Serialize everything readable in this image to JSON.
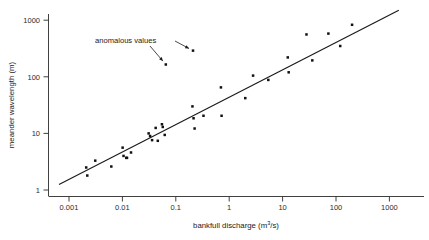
{
  "chart_data": {
    "type": "scatter",
    "title": "",
    "xlabel": "bankfull discharge (m³/s)",
    "xlabel_main": "bankfull discharge (m",
    "xlabel_sup": "3",
    "xlabel_tail": "/s)",
    "ylabel": "meander wavelength (m)",
    "xscale": "log",
    "yscale": "log",
    "xlim": [
      0.0005,
      2000
    ],
    "ylim": [
      0.65,
      2200
    ],
    "xticks": [
      0.001,
      0.01,
      0.1,
      1,
      10,
      100,
      1000
    ],
    "xtick_labels": [
      "0.001",
      "0.01",
      "0.1",
      "1",
      "10",
      "100",
      "1000"
    ],
    "yticks": [
      1,
      10,
      100,
      1000
    ],
    "ytick_labels": [
      "1",
      "10",
      "100",
      "1000"
    ],
    "grid": false,
    "legend": null,
    "marker": "filled-square",
    "marker_color": "#111111",
    "line_color": "#1a1a1a",
    "fit_line": {
      "label": "regression line",
      "x_start": 0.00065,
      "y_start": 1.25,
      "x_end": 1500,
      "y_end": 1500
    },
    "annotations": [
      {
        "text": "anomalous values",
        "points": [
          {
            "x": 0.065,
            "y": 165
          },
          {
            "x": 0.21,
            "y": 290
          }
        ]
      }
    ],
    "points": [
      {
        "x": 0.0021,
        "y": 2.5
      },
      {
        "x": 0.0022,
        "y": 1.8
      },
      {
        "x": 0.0031,
        "y": 3.3
      },
      {
        "x": 0.0062,
        "y": 2.6
      },
      {
        "x": 0.0101,
        "y": 5.6
      },
      {
        "x": 0.0105,
        "y": 4.0
      },
      {
        "x": 0.0118,
        "y": 3.7
      },
      {
        "x": 0.0122,
        "y": 3.7
      },
      {
        "x": 0.0145,
        "y": 4.6
      },
      {
        "x": 0.031,
        "y": 10.0
      },
      {
        "x": 0.033,
        "y": 9.0
      },
      {
        "x": 0.036,
        "y": 7.6
      },
      {
        "x": 0.042,
        "y": 12.5
      },
      {
        "x": 0.046,
        "y": 7.4
      },
      {
        "x": 0.055,
        "y": 14.5
      },
      {
        "x": 0.057,
        "y": 13.0
      },
      {
        "x": 0.062,
        "y": 9.4
      },
      {
        "x": 0.065,
        "y": 165
      },
      {
        "x": 0.21,
        "y": 290
      },
      {
        "x": 0.205,
        "y": 30
      },
      {
        "x": 0.215,
        "y": 18.5
      },
      {
        "x": 0.225,
        "y": 12.2
      },
      {
        "x": 0.33,
        "y": 20.5
      },
      {
        "x": 0.7,
        "y": 65
      },
      {
        "x": 0.72,
        "y": 20.5
      },
      {
        "x": 2.0,
        "y": 42
      },
      {
        "x": 2.8,
        "y": 105
      },
      {
        "x": 5.4,
        "y": 88
      },
      {
        "x": 12.5,
        "y": 220
      },
      {
        "x": 13.0,
        "y": 120
      },
      {
        "x": 28.0,
        "y": 560
      },
      {
        "x": 36.0,
        "y": 195
      },
      {
        "x": 72.0,
        "y": 580
      },
      {
        "x": 120.0,
        "y": 350
      },
      {
        "x": 200.0,
        "y": 830
      }
    ]
  }
}
